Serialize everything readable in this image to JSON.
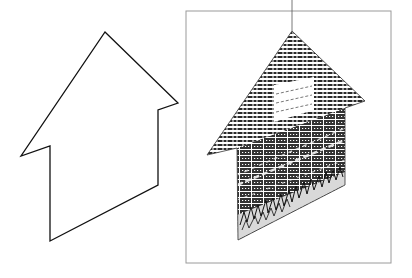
{
  "figure": {
    "left_panel": {
      "label": "house-outline",
      "stroke_color": "#111111",
      "points": [
        [
          105,
          32
        ],
        [
          178,
          103
        ],
        [
          158,
          110
        ],
        [
          158,
          185
        ],
        [
          50,
          241
        ],
        [
          50,
          146
        ],
        [
          21,
          156
        ]
      ]
    },
    "right_panel": {
      "label": "textured-house",
      "frame": {
        "x": 186,
        "y": 11,
        "width": 205,
        "height": 252,
        "stroke_color": "#9a9a9a"
      },
      "hanging_line": {
        "x": 292,
        "y1": 0,
        "y2": 31
      },
      "roof_points": [
        [
          292,
          31
        ],
        [
          365,
          101
        ],
        [
          345,
          108
        ],
        [
          237,
          148
        ],
        [
          207,
          155
        ]
      ],
      "wall_points": [
        [
          237,
          148
        ],
        [
          345,
          108
        ],
        [
          345,
          185
        ],
        [
          238,
          240
        ]
      ],
      "window_points": [
        [
          274,
          85
        ],
        [
          314,
          77
        ],
        [
          314,
          110
        ],
        [
          274,
          122
        ]
      ],
      "colors": {
        "roof_dark": "#2a2a2a",
        "brick_dark": "#333333",
        "ground_fill": "#d9d9d9",
        "window_fill": "#ffffff"
      }
    }
  }
}
